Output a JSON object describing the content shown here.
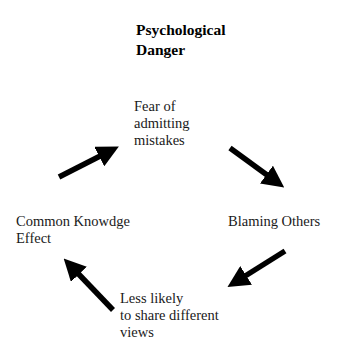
{
  "diagram": {
    "title_line1": "Psychological",
    "title_line2": "Danger",
    "nodes": [
      {
        "id": "fear",
        "lines": [
          "Fear  of",
          "admitting",
          "mistakes"
        ]
      },
      {
        "id": "blaming",
        "lines": [
          "Blaming Others"
        ]
      },
      {
        "id": "less_likely",
        "lines": [
          "Less likely",
          "to share different",
          "views"
        ]
      },
      {
        "id": "common",
        "lines": [
          "Common Knowdge",
          "Effect"
        ]
      }
    ],
    "edges": [
      {
        "from": "common",
        "to": "fear"
      },
      {
        "from": "fear",
        "to": "blaming"
      },
      {
        "from": "blaming",
        "to": "less_likely"
      },
      {
        "from": "less_likely",
        "to": "common"
      }
    ],
    "arrow_color": "#000000"
  }
}
